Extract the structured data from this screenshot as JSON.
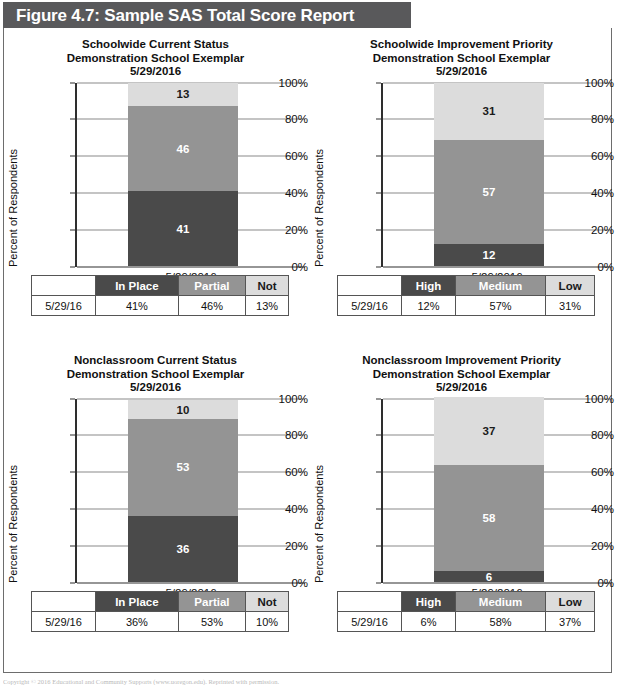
{
  "figure": {
    "title": "Figure 4.7: Sample SAS Total Score Report",
    "title_bar_color": "#59595b"
  },
  "colors": {
    "dark": "#4a4a4a",
    "medium": "#949494",
    "light": "#dcdcdc",
    "axis": "#2e2e2e",
    "grid": "#8a8a8a"
  },
  "copyright": "Copyright © 2016 Educational and Community Supports (www.uoregon.edu). Reprinted with permission.",
  "panels": {
    "tl": {
      "title_line1": "Schoolwide Current Status",
      "title_line2": "Demonstration School Exemplar",
      "title_line3": "5/29/2016",
      "ylabel": "Percent of Respondents",
      "xlabel": "5/29/2016",
      "yticks": [
        "0%",
        "20%",
        "40%",
        "60%",
        "80%",
        "100%"
      ],
      "table": {
        "row_label_header": "",
        "headers": [
          "In Place",
          "Partial",
          "Not"
        ],
        "row_label": "5/29/16",
        "values": [
          "41%",
          "46%",
          "13%"
        ]
      }
    },
    "tr": {
      "title_line1": "Schoolwide Improvement Priority",
      "title_line2": "Demonstration School Exemplar",
      "title_line3": "5/29/2016",
      "ylabel": "Percent of Respondents",
      "xlabel": "5/29/2016",
      "yticks": [
        "0%",
        "20%",
        "40%",
        "60%",
        "80%",
        "100%"
      ],
      "table": {
        "row_label_header": "",
        "headers": [
          "High",
          "Medium",
          "Low"
        ],
        "row_label": "5/29/16",
        "values": [
          "12%",
          "57%",
          "31%"
        ]
      }
    },
    "bl": {
      "title_line1": "Nonclassroom Current Status",
      "title_line2": "Demonstration School Exemplar",
      "title_line3": "5/29/2016",
      "ylabel": "Percent of Respondents",
      "xlabel": "5/29/2016",
      "yticks": [
        "0%",
        "20%",
        "40%",
        "60%",
        "80%",
        "100%"
      ],
      "table": {
        "row_label_header": "",
        "headers": [
          "In Place",
          "Partial",
          "Not"
        ],
        "row_label": "5/29/16",
        "values": [
          "36%",
          "53%",
          "10%"
        ]
      }
    },
    "br": {
      "title_line1": "Nonclassroom Improvement Priority",
      "title_line2": "Demonstration School Exemplar",
      "title_line3": "5/29/2016",
      "ylabel": "Percent of Respondents",
      "xlabel": "5/29/2016",
      "yticks": [
        "0%",
        "20%",
        "40%",
        "60%",
        "80%",
        "100%"
      ],
      "table": {
        "row_label_header": "",
        "headers": [
          "High",
          "Medium",
          "Low"
        ],
        "row_label": "5/29/16",
        "values": [
          "6%",
          "58%",
          "37%"
        ]
      }
    }
  },
  "chart_data": [
    {
      "id": "tl",
      "type": "bar",
      "stacked": true,
      "title": "Schoolwide Current Status / Demonstration School Exemplar / 5/29/2016",
      "xlabel": "",
      "ylabel": "Percent of Respondents",
      "categories": [
        "5/29/2016"
      ],
      "ylim": [
        0,
        100
      ],
      "yticks": [
        0,
        20,
        40,
        60,
        80,
        100
      ],
      "grid": true,
      "legend": "below-as-table",
      "series": [
        {
          "name": "In Place",
          "values": [
            41
          ],
          "color": "#4a4a4a",
          "label": "41"
        },
        {
          "name": "Partial",
          "values": [
            46
          ],
          "color": "#949494",
          "label": "46"
        },
        {
          "name": "Not",
          "values": [
            13
          ],
          "color": "#dcdcdc",
          "label": "13"
        }
      ]
    },
    {
      "id": "tr",
      "type": "bar",
      "stacked": true,
      "title": "Schoolwide Improvement Priority / Demonstration School Exemplar / 5/29/2016",
      "xlabel": "",
      "ylabel": "Percent of Respondents",
      "categories": [
        "5/29/2016"
      ],
      "ylim": [
        0,
        100
      ],
      "yticks": [
        0,
        20,
        40,
        60,
        80,
        100
      ],
      "grid": true,
      "legend": "below-as-table",
      "series": [
        {
          "name": "High",
          "values": [
            12
          ],
          "color": "#4a4a4a",
          "label": "12"
        },
        {
          "name": "Medium",
          "values": [
            57
          ],
          "color": "#949494",
          "label": "57"
        },
        {
          "name": "Low",
          "values": [
            31
          ],
          "color": "#dcdcdc",
          "label": "31"
        }
      ]
    },
    {
      "id": "bl",
      "type": "bar",
      "stacked": true,
      "title": "Nonclassroom Current Status / Demonstration School Exemplar / 5/29/2016",
      "xlabel": "",
      "ylabel": "Percent of Respondents",
      "categories": [
        "5/29/2016"
      ],
      "ylim": [
        0,
        100
      ],
      "yticks": [
        0,
        20,
        40,
        60,
        80,
        100
      ],
      "grid": true,
      "legend": "below-as-table",
      "series": [
        {
          "name": "In Place",
          "values": [
            36
          ],
          "color": "#4a4a4a",
          "label": "36"
        },
        {
          "name": "Partial",
          "values": [
            53
          ],
          "color": "#949494",
          "label": "53"
        },
        {
          "name": "Not",
          "values": [
            10
          ],
          "color": "#dcdcdc",
          "label": "10"
        }
      ]
    },
    {
      "id": "br",
      "type": "bar",
      "stacked": true,
      "title": "Nonclassroom Improvement Priority / Demonstration School Exemplar / 5/29/2016",
      "xlabel": "",
      "ylabel": "Percent of Respondents",
      "categories": [
        "5/29/2016"
      ],
      "ylim": [
        0,
        100
      ],
      "yticks": [
        0,
        20,
        40,
        60,
        80,
        100
      ],
      "grid": true,
      "legend": "below-as-table",
      "series": [
        {
          "name": "High",
          "values": [
            6
          ],
          "color": "#4a4a4a",
          "label": "6"
        },
        {
          "name": "Medium",
          "values": [
            58
          ],
          "color": "#949494",
          "label": "58"
        },
        {
          "name": "Low",
          "values": [
            37
          ],
          "color": "#dcdcdc",
          "label": "37"
        }
      ]
    }
  ]
}
